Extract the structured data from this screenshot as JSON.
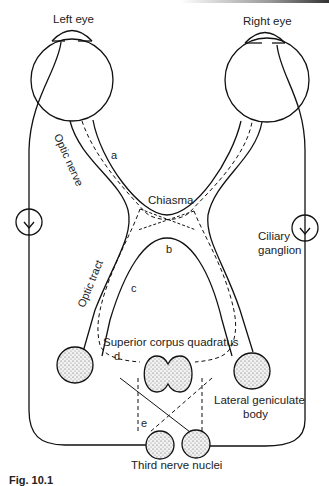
{
  "diagram": {
    "labels": {
      "left_eye": "Left eye",
      "right_eye": "Right eye",
      "optic_nerve": "Optic nerve",
      "optic_tract": "Optic tract",
      "chiasma": "Chiasma",
      "ciliary_ganglion_line1": "Ciliary",
      "ciliary_ganglion_line2": "ganglion",
      "superior_corpus_quadratus": "Superior corpus quadratus",
      "lateral_geniculate_line1": "Lateral geniculate",
      "lateral_geniculate_line2": "body",
      "third_nerve_nuclei": "Third nerve nuclei"
    },
    "lesion_markers": [
      "a",
      "b",
      "c",
      "d",
      "e"
    ],
    "caption": "Fig. 10.1"
  },
  "colors": {
    "stroke": "#111111",
    "text": "#222222",
    "stipple_fill": "#e8e8e8",
    "background": "#ffffff"
  }
}
